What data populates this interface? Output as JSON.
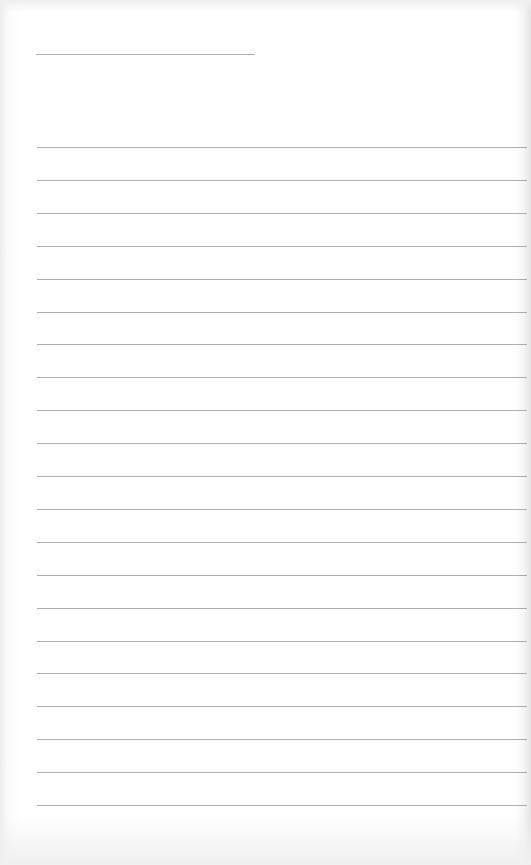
{
  "paper": {
    "type": "lined-paper",
    "line_color": "#9a9a9a",
    "title_line": {
      "x": 36,
      "y": 54,
      "width": 219
    },
    "ruled_lines": {
      "x": 37,
      "width": 490,
      "start_y": 147,
      "spacing": 32.9,
      "count": 21
    }
  }
}
